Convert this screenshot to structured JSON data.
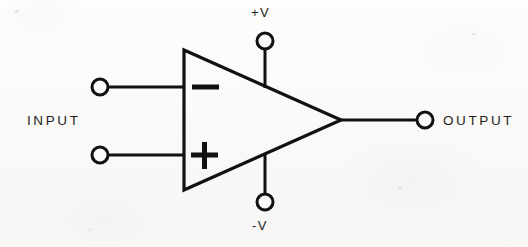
{
  "diagram": {
    "type": "schematic",
    "background_color": "#fbfbf9",
    "line_color": "#111111",
    "labels": {
      "input": "INPUT",
      "output": "OUTPUT",
      "supply_positive": "+V",
      "supply_negative": "-V",
      "inverting_symbol": "−",
      "noninverting_symbol": "+"
    },
    "terminals": [
      {
        "name": "inverting-input",
        "label": "",
        "cx": 100,
        "cy": 87,
        "r": 8
      },
      {
        "name": "noninverting-input",
        "label": "",
        "cx": 100,
        "cy": 155,
        "r": 8
      },
      {
        "name": "positive-supply",
        "label": "+V",
        "cx": 265,
        "cy": 41,
        "r": 8
      },
      {
        "name": "negative-supply",
        "label": "-V",
        "cx": 265,
        "cy": 202,
        "r": 8
      },
      {
        "name": "output",
        "label": "OUTPUT",
        "cx": 425,
        "cy": 120,
        "r": 8
      }
    ],
    "amplifier_body": {
      "name": "triangle",
      "points": "184,50 184,190 341,120",
      "stroke_width": 3.2
    }
  }
}
